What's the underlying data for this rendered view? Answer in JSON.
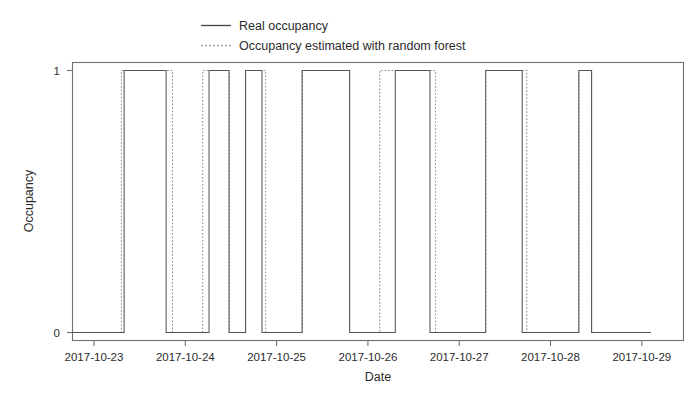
{
  "chart_data": {
    "type": "line",
    "title": "",
    "xlabel": "Date",
    "ylabel": "Occupancy",
    "grid": false,
    "legend_position": "top-center",
    "ylim": [
      0,
      1
    ],
    "yticks": [
      0,
      1
    ],
    "ytick_labels": [
      "0",
      "1"
    ],
    "xlim": [
      "2017-10-22.78",
      "2017-10-29.47"
    ],
    "xtick_labels": [
      "2017-10-23",
      "2017-10-24",
      "2017-10-25",
      "2017-10-26",
      "2017-10-27",
      "2017-10-28",
      "2017-10-29"
    ],
    "xticks_days": [
      0,
      1,
      2,
      3,
      4,
      5,
      6
    ],
    "series": [
      {
        "name": "Real occupancy",
        "style": "solid",
        "color": "#555555",
        "step_points_days": [
          [
            -0.24,
            0
          ],
          [
            0.33,
            0
          ],
          [
            0.33,
            1
          ],
          [
            0.79,
            1
          ],
          [
            0.79,
            0
          ],
          [
            1.26,
            0
          ],
          [
            1.26,
            1
          ],
          [
            1.48,
            1
          ],
          [
            1.48,
            0
          ],
          [
            1.66,
            0
          ],
          [
            1.66,
            1
          ],
          [
            1.84,
            1
          ],
          [
            1.84,
            0
          ],
          [
            2.28,
            0
          ],
          [
            2.28,
            1
          ],
          [
            2.8,
            1
          ],
          [
            2.8,
            0
          ],
          [
            3.3,
            0
          ],
          [
            3.3,
            1
          ],
          [
            3.68,
            1
          ],
          [
            3.68,
            0
          ],
          [
            4.29,
            0
          ],
          [
            4.29,
            1
          ],
          [
            4.69,
            1
          ],
          [
            4.69,
            0
          ],
          [
            5.31,
            0
          ],
          [
            5.31,
            1
          ],
          [
            5.45,
            1
          ],
          [
            5.45,
            0
          ],
          [
            6.1,
            0
          ]
        ]
      },
      {
        "name": "Occupancy estimated with random forest",
        "style": "dotted",
        "color": "#8d8d8d",
        "step_points_days": [
          [
            -0.24,
            0
          ],
          [
            0.3,
            0
          ],
          [
            0.3,
            1
          ],
          [
            0.86,
            1
          ],
          [
            0.86,
            0
          ],
          [
            1.19,
            0
          ],
          [
            1.19,
            1
          ],
          [
            1.48,
            1
          ],
          [
            1.48,
            0
          ],
          [
            1.66,
            0
          ],
          [
            1.66,
            1
          ],
          [
            1.88,
            1
          ],
          [
            1.88,
            0
          ],
          [
            2.28,
            0
          ],
          [
            2.28,
            1
          ],
          [
            2.8,
            1
          ],
          [
            2.8,
            0
          ],
          [
            3.13,
            0
          ],
          [
            3.13,
            1
          ],
          [
            3.74,
            1
          ],
          [
            3.74,
            0
          ],
          [
            4.29,
            0
          ],
          [
            4.29,
            1
          ],
          [
            4.74,
            1
          ],
          [
            4.74,
            0
          ],
          [
            5.31,
            0
          ],
          [
            5.31,
            1
          ],
          [
            5.45,
            1
          ],
          [
            5.45,
            0
          ],
          [
            6.1,
            0
          ]
        ]
      }
    ]
  },
  "legend": {
    "items": [
      {
        "label": "Real occupancy",
        "style": "solid"
      },
      {
        "label": "Occupancy estimated with random forest",
        "style": "dotted"
      }
    ]
  },
  "axes": {
    "y_title": "Occupancy",
    "x_title": "Date",
    "y_tick_0": "0",
    "y_tick_1": "1",
    "x_tick_0": "2017-10-23",
    "x_tick_1": "2017-10-24",
    "x_tick_2": "2017-10-25",
    "x_tick_3": "2017-10-26",
    "x_tick_4": "2017-10-27",
    "x_tick_5": "2017-10-28",
    "x_tick_6": "2017-10-29"
  },
  "colors": {
    "real_series": "#555555",
    "estimated_series": "#8d8d8d",
    "frame": "#6f6f6f",
    "text": "#2b2b2b",
    "background": "#ffffff"
  }
}
